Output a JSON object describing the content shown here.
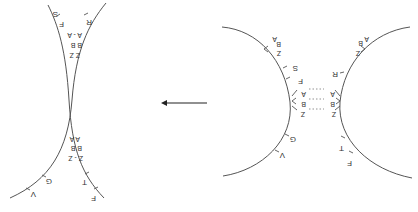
{
  "diagram": {
    "orientation": "rotated-180",
    "colors": {
      "curve": "#555555",
      "arrow": "#222222",
      "text": "#333333"
    },
    "before": {
      "left_arc": {
        "end_labels": {
          "A": "A",
          "B": "B",
          "Z": "Z"
        },
        "junction_labels": {
          "A": "A",
          "B": "B",
          "Z": "Z"
        },
        "tick_labels": [
          "S",
          "F",
          "G",
          "V"
        ]
      },
      "right_arc": {
        "end_labels": {
          "A": "A",
          "B": "B",
          "Z": "Z"
        },
        "junction_labels": {
          "A": "A",
          "B": "B",
          "Z": "Z"
        },
        "tick_labels": [
          "R",
          "T",
          "F"
        ]
      }
    },
    "arrow": {
      "direction": "left"
    },
    "after": {
      "top_labels": [
        "S",
        "F",
        "R"
      ],
      "upper_junction": {
        "row1": "A - A",
        "row2": "B B",
        "row3": "Z Z"
      },
      "lower_junction": {
        "row1": "A A",
        "row2": "B B",
        "row3": "Z - Z"
      },
      "bottom_labels": [
        "G",
        "V",
        "T",
        "F"
      ]
    }
  }
}
